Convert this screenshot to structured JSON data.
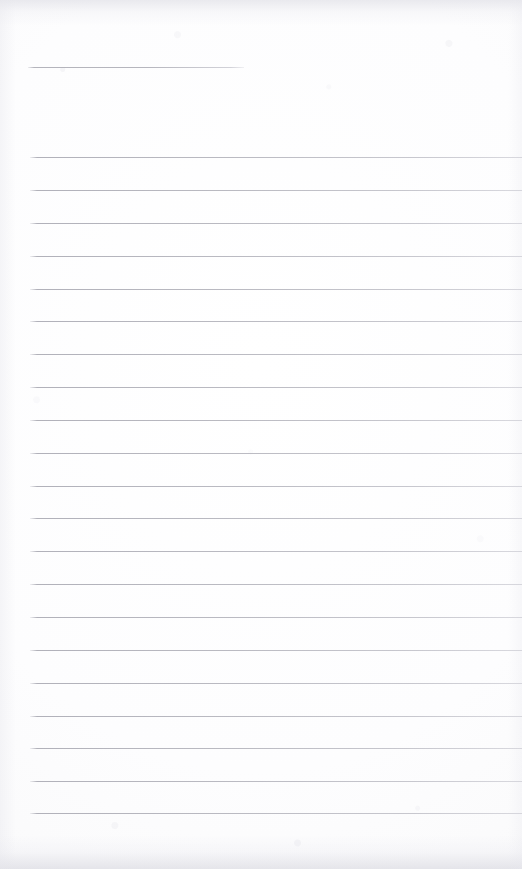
{
  "document": {
    "type": "lined-notebook-paper",
    "title": "",
    "page_width": 522,
    "page_height": 869,
    "content_text": "",
    "is_blank": true
  },
  "colors": {
    "paper_background": "#fdfdfd",
    "rule_line": "#b3b3bb",
    "edge_shadow": "#dddde4"
  },
  "header_rule": {
    "label": "header-rule",
    "x_start": 28,
    "x_end": 244,
    "y": 67,
    "thickness": 1
  },
  "body_rules": {
    "label": "body-rules",
    "x_start": 30,
    "x_end": 522,
    "thickness": 1,
    "spacing": 32.8,
    "count": 21,
    "y_positions": [
      157,
      190,
      223,
      256,
      289,
      321,
      354,
      387,
      420,
      453,
      486,
      518,
      551,
      584,
      617,
      650,
      683,
      716,
      748,
      781,
      813
    ]
  }
}
